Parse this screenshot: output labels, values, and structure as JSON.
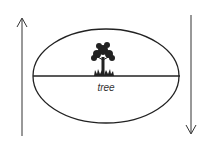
{
  "diagram": {
    "label": "tree",
    "elements": [
      {
        "type": "arrow",
        "direction": "up",
        "position": "left"
      },
      {
        "type": "ellipse",
        "divided_by": "horizontal-line"
      },
      {
        "type": "icon",
        "name": "tree-icon",
        "position": "on-line, center"
      },
      {
        "type": "arrow",
        "direction": "down",
        "position": "right"
      }
    ],
    "colors": {
      "stroke": "#222222",
      "background": "#ffffff"
    }
  }
}
